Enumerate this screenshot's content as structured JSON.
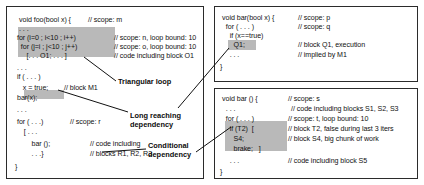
{
  "figure": {
    "highlight_color": "#b9b9b9",
    "border_color": "#2b2b2b",
    "background": "#ffffff"
  },
  "panels": {
    "foo": {
      "name": "void foo",
      "lines": [
        {
          "code": "void foo(bool x) {",
          "comment": "// scope: m"
        },
        {
          "code": ". . .",
          "comment": ""
        },
        {
          "code": "for (i=0 ; i<10 ; i++)",
          "comment": "// scope: n, loop bound: 10"
        },
        {
          "code": "  for (j=i ; j<10 ; j++)",
          "comment": "// scope: o, loop bound: 10"
        },
        {
          "code": "     [. . . O1; . . . ]",
          "comment": "// code including block O1"
        },
        {
          "code": ". . .",
          "comment": ""
        },
        {
          "code": "if ( . . . )",
          "comment": ""
        },
        {
          "code": "  x = true;",
          "comment": "// block M1"
        },
        {
          "code": "bar(x);",
          "comment": ""
        },
        {
          "code": ". . .",
          "comment": ""
        },
        {
          "code": "for ( . . .)",
          "comment": "// scope: r"
        },
        {
          "code": "  [ . . .",
          "comment": ""
        },
        {
          "code": "      bar ();",
          "comment": "// code including"
        },
        {
          "code": "      . . .}",
          "comment": "// blocks R1, R2, R3"
        },
        {
          "code": "}",
          "comment": ""
        }
      ]
    },
    "bar_q": {
      "name": "void bar(bool x)",
      "lines": [
        {
          "code": "void bar(bool x) {",
          "comment": "// scope: p"
        },
        {
          "code": "  for ( . . . )",
          "comment": "// scope: q"
        },
        {
          "code": "    if (x==true)",
          "comment": ""
        },
        {
          "code": "      Q1;",
          "comment": "// block Q1, execution"
        },
        {
          "code": "    . . .",
          "comment": "// implied by M1"
        },
        {
          "code": "}",
          "comment": ""
        }
      ]
    },
    "bar_s": {
      "name": "void bar ()",
      "lines": [
        {
          "code": "void bar () {",
          "comment": "// scope: s"
        },
        {
          "code": "  . . .",
          "comment": "// code including blocks S1, S2, S3"
        },
        {
          "code": "  for ( . . . )",
          "comment": "// scope: t, loop bound: 10"
        },
        {
          "code": "    if (T2)  [",
          "comment": "// block T2, false during last 3 iters"
        },
        {
          "code": "      S4;",
          "comment": "// block S4, big chunk of work"
        },
        {
          "code": "      brake;   ]",
          "comment": ""
        },
        {
          "code": "    . . .",
          "comment": "// code including block S5"
        },
        {
          "code": "}",
          "comment": ""
        }
      ]
    }
  },
  "annotations": [
    {
      "id": "triangular-loop",
      "label": "Triangular loop"
    },
    {
      "id": "long-reaching-dependency",
      "label": "Long reaching\ndependency"
    },
    {
      "id": "conditional-dependency",
      "label": "Conditional\ndependency"
    }
  ]
}
